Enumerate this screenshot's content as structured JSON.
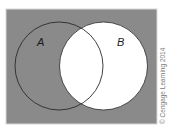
{
  "diagram": {
    "type": "venn",
    "universe": {
      "fill": "#8a8a8a",
      "border": "#d8d8d8"
    },
    "sets": [
      {
        "id": "A",
        "label": "A",
        "fill": "#8a8a8a",
        "stroke": "#2a2a2a"
      },
      {
        "id": "B",
        "label": "B",
        "fill": "#ffffff",
        "stroke": "#3a3a3a"
      }
    ],
    "shaded_region": "complement of B (U minus B)",
    "credit": "© Cengage Learning 2014"
  }
}
